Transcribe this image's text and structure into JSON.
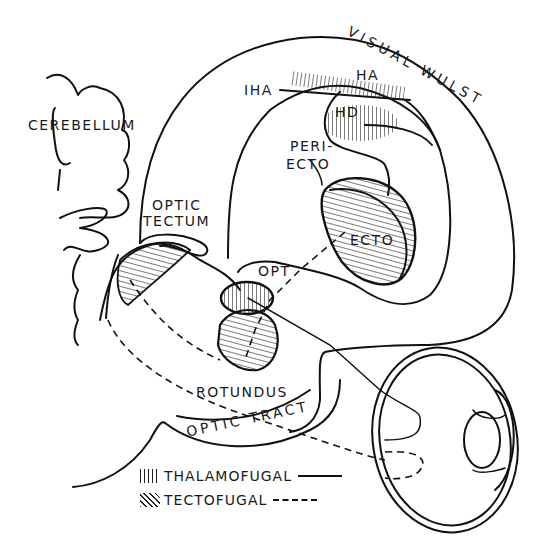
{
  "figure": {
    "colors": {
      "ink": "#111111",
      "background": "#ffffff"
    }
  },
  "labels": {
    "cerebellum": "CEREBELLUM",
    "visual_wulst": "VISUAL WULST",
    "iha": "IHA",
    "ha": "HA",
    "hd": "HD",
    "periecto_line1": "PERI-",
    "periecto_line2": "ECTO",
    "ecto": "ECTO",
    "optic_tectum_line1": "OPTIC",
    "optic_tectum_line2": "TECTUM",
    "opt": "OPT",
    "rotundus": "ROTUNDUS",
    "optic_tract": "OPTIC TRACT"
  },
  "legend": {
    "items": [
      {
        "label": "THALAMOFUGAL",
        "hatch": "vertical",
        "line": "solid"
      },
      {
        "label": "TECTOFUGAL",
        "hatch": "diagonal",
        "line": "dashed"
      }
    ]
  }
}
